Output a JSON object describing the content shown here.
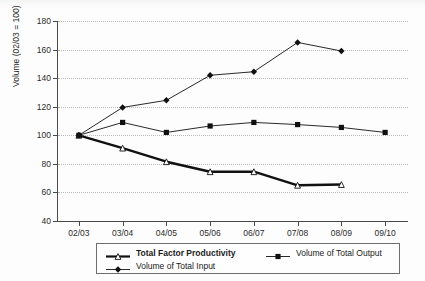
{
  "chart_data": {
    "type": "line",
    "title": "",
    "xlabel": "",
    "ylabel": "Volume (02/03 = 100)",
    "categories": [
      "02/03",
      "03/04",
      "04/05",
      "05/06",
      "06/07",
      "07/08",
      "08/09",
      "09/10"
    ],
    "ylim": [
      40,
      180
    ],
    "yticks": [
      40,
      60,
      80,
      100,
      120,
      140,
      160,
      180
    ],
    "grid": true,
    "legend_position": "bottom",
    "series": [
      {
        "name": "Total Factor Productivity",
        "marker": "triangle-open",
        "emphasis": "bold",
        "values": [
          100,
          91,
          81.5,
          74.5,
          74.5,
          65,
          65.5,
          null
        ]
      },
      {
        "name": "Volume of Total Output",
        "marker": "square",
        "emphasis": "normal",
        "values": [
          100,
          109,
          102,
          106.5,
          109,
          107.5,
          105.5,
          102
        ]
      },
      {
        "name": "Volume of Total Input",
        "marker": "diamond",
        "emphasis": "normal",
        "values": [
          100,
          119.5,
          124.5,
          142,
          144.5,
          165,
          159,
          null
        ]
      }
    ],
    "colors": {
      "line": "#1a1a1a",
      "grid": "#b9b9b9",
      "axis": "#4a4a4a",
      "background": "#fdfdfd"
    }
  },
  "legend": {
    "items": [
      {
        "label": "Total Factor Productivity",
        "marker": "triangle-open",
        "bold": true
      },
      {
        "label": "Volume of Total Output",
        "marker": "square",
        "bold": false
      },
      {
        "label": "Volume of Total Input",
        "marker": "diamond",
        "bold": false
      }
    ]
  }
}
